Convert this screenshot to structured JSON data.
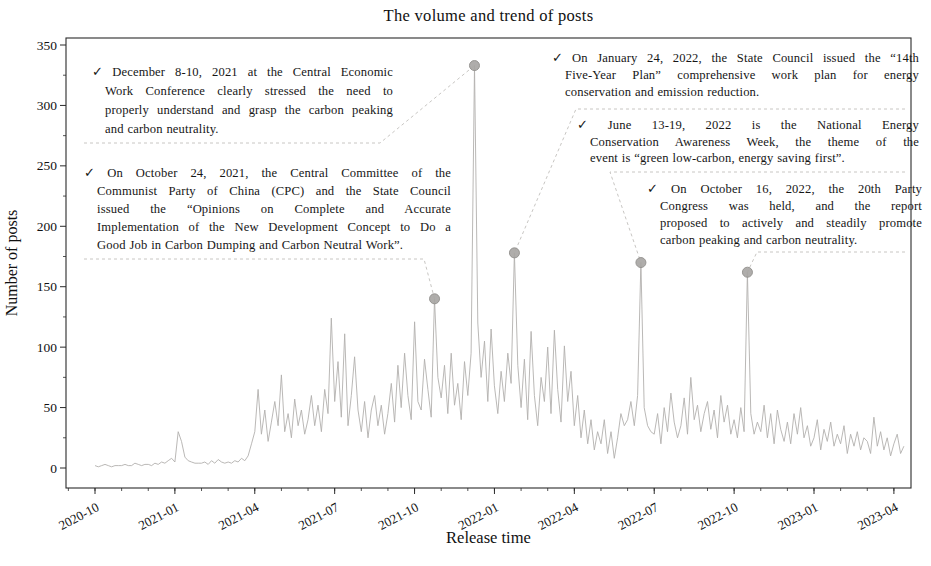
{
  "chart_data": {
    "type": "line",
    "title": "The volume and trend of posts",
    "xlabel": "Release time",
    "ylabel": "Number of posts",
    "grid": false,
    "legend": "none",
    "ylim": [
      0,
      350
    ],
    "y_ticks": [
      0,
      50,
      100,
      150,
      200,
      250,
      300,
      350
    ],
    "x_tick_labels": [
      "2020-10",
      "2021-01",
      "2021-04",
      "2021-07",
      "2021-10",
      "2022-01",
      "2022-04",
      "2022-07",
      "2022-10",
      "2023-01",
      "2023-04"
    ],
    "x_tick_month_offsets": [
      0,
      3,
      6,
      9,
      12,
      15,
      18,
      21,
      24,
      27,
      30
    ],
    "series_start_month_offset": 0,
    "series_month_step": 0.125,
    "values": [
      2,
      1,
      2,
      3,
      2,
      1,
      2,
      2,
      2,
      3,
      2,
      2,
      4,
      3,
      2,
      3,
      3,
      2,
      4,
      3,
      5,
      4,
      6,
      8,
      5,
      30,
      22,
      9,
      6,
      5,
      4,
      4,
      4,
      5,
      3,
      6,
      4,
      7,
      5,
      4,
      5,
      4,
      6,
      5,
      8,
      6,
      10,
      20,
      30,
      65,
      28,
      48,
      22,
      38,
      55,
      35,
      77,
      30,
      45,
      25,
      57,
      35,
      48,
      28,
      40,
      60,
      35,
      52,
      30,
      65,
      45,
      124,
      55,
      88,
      42,
      111,
      35,
      60,
      92,
      48,
      30,
      55,
      25,
      48,
      60,
      35,
      52,
      28,
      45,
      70,
      38,
      85,
      50,
      95,
      60,
      40,
      121,
      55,
      48,
      90,
      65,
      42,
      140,
      75,
      58,
      85,
      45,
      95,
      52,
      70,
      40,
      88,
      60,
      95,
      333,
      120,
      75,
      105,
      55,
      115,
      68,
      45,
      80,
      55,
      95,
      70,
      178,
      85,
      50,
      90,
      40,
      113,
      60,
      35,
      75,
      55,
      100,
      45,
      114,
      65,
      38,
      101,
      55,
      80,
      35,
      60,
      25,
      48,
      20,
      40,
      15,
      30,
      20,
      40,
      12,
      30,
      8,
      25,
      45,
      35,
      40,
      55,
      35,
      60,
      170,
      50,
      35,
      30,
      28,
      45,
      20,
      50,
      30,
      62,
      38,
      25,
      35,
      58,
      28,
      75,
      40,
      52,
      30,
      45,
      55,
      32,
      48,
      25,
      60,
      38,
      52,
      28,
      40,
      25,
      50,
      30,
      162,
      45,
      28,
      38,
      30,
      52,
      25,
      45,
      20,
      48,
      32,
      22,
      38,
      20,
      45,
      28,
      50,
      25,
      35,
      18,
      25,
      40,
      15,
      32,
      22,
      38,
      18,
      28,
      20,
      35,
      12,
      28,
      18,
      30,
      15,
      25,
      22,
      12,
      42,
      18,
      30,
      15,
      25,
      10,
      20,
      28,
      12,
      18
    ],
    "events": [
      {
        "date": "2021-10-24",
        "month_offset": 12.75,
        "value": 140,
        "annotation_index": 1
      },
      {
        "date": "2021-12-09",
        "month_offset": 14.25,
        "value": 333,
        "annotation_index": 0
      },
      {
        "date": "2022-01-24",
        "month_offset": 15.75,
        "value": 178,
        "annotation_index": 2
      },
      {
        "date": "2022-06-16",
        "month_offset": 20.5,
        "value": 170,
        "annotation_index": 3
      },
      {
        "date": "2022-10-16",
        "month_offset": 24.5,
        "value": 162,
        "annotation_index": 4
      }
    ]
  },
  "annotations": [
    {
      "bullet": "✓",
      "lines": [
        "December 8-10, 2021 at the Central Economic",
        "Work Conference clearly stressed the need to",
        "properly understand and grasp the carbon peaking",
        "and carbon neutrality."
      ]
    },
    {
      "bullet": "✓",
      "lines": [
        "On October 24, 2021, the Central Committee of the",
        "Communist Party of China (CPC) and the State Council",
        "issued the “Opinions on Complete and Accurate",
        "Implementation of the New Development Concept to Do a",
        "Good Job in Carbon Dumping and Carbon Neutral Work”."
      ]
    },
    {
      "bullet": "✓",
      "lines": [
        "On January 24, 2022, the State Council issued the “14th",
        "Five-Year Plan” comprehensive work plan for energy",
        "conservation and emission reduction."
      ]
    },
    {
      "bullet": "✓",
      "lines": [
        "June 13-19, 2022 is the National Energy",
        "Conservation Awareness Week, the theme of the",
        "event is “green low-carbon, energy saving first”."
      ]
    },
    {
      "bullet": "✓",
      "lines": [
        "On October 16, 2022, the 20th Party",
        "Congress was held, and the report",
        "proposed to actively and steadily promote",
        "carbon peaking and carbon neutrality."
      ]
    }
  ],
  "colors": {
    "series_line": "#b2b0ae",
    "marker_fill": "#a9a7a4",
    "marker_edge": "#8f8d8a",
    "leader_line": "#c8c6c3",
    "axis": "#2a2a2a",
    "text": "#111111"
  }
}
